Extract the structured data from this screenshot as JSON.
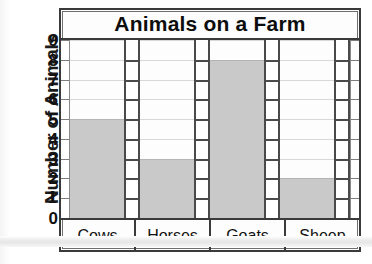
{
  "chart_data": {
    "type": "bar",
    "title": "Animals on a Farm",
    "xlabel": "",
    "ylabel": "Number of Animals",
    "categories": [
      "Cows",
      "Horses",
      "Goats",
      "Sheep"
    ],
    "values": [
      5,
      3,
      8,
      2
    ],
    "ylim": [
      0,
      9
    ],
    "ytick_labels": [
      "0",
      "1",
      "2",
      "3",
      "4",
      "5",
      "6",
      "7",
      "8",
      "9"
    ],
    "ytick_values": [
      0,
      1,
      2,
      3,
      4,
      5,
      6,
      7,
      8,
      9
    ],
    "grid": true,
    "legend": null,
    "bar_color": "#c9c9c9",
    "frame_color": "#3a3a3a",
    "background_color": "#fdfdfd",
    "series": [
      {
        "name": "Number of Animals",
        "values": [
          5,
          3,
          8,
          2
        ]
      }
    ]
  }
}
